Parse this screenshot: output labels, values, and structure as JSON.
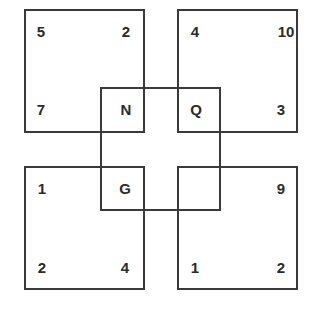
{
  "puzzle": {
    "top_left": {
      "tl": "5",
      "tr": "2",
      "bl": "7",
      "br": "N"
    },
    "top_right": {
      "tl": "4",
      "tr": "10",
      "bl": "Q",
      "br": "3"
    },
    "bottom_left": {
      "tl": "1",
      "tr": "G",
      "bl": "2",
      "br": "4"
    },
    "bottom_right": {
      "tl": "",
      "tr": "9",
      "bl": "1",
      "br": "2"
    }
  },
  "colors": {
    "line": "#3a3a3a",
    "text": "#2b2b2b",
    "background": "#ffffff"
  }
}
